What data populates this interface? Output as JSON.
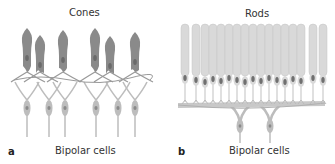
{
  "figure": {
    "panels": [
      {
        "letter": "a",
        "title": "Cones",
        "bottom_label": "Bipolar cells",
        "cone_x": [
          27,
          40,
          63,
          95,
          110,
          135
        ],
        "cone_top": [
          28,
          35,
          30,
          28,
          36,
          32
        ],
        "bipolar_x": [
          27,
          49,
          65,
          96,
          118,
          135
        ]
      },
      {
        "letter": "b",
        "title": "Rods",
        "bottom_label": "Bipolar cells",
        "rod_x": [
          185,
          196,
          205,
          213,
          221,
          229,
          237,
          245,
          253,
          261,
          269,
          277,
          285,
          293,
          301,
          313,
          323
        ],
        "bipolar_x": [
          240,
          270
        ]
      }
    ],
    "colors": {
      "cone_fill": "#8a8a8a",
      "cone_nucleus": "#6a6a6a",
      "rod_fill": "#d9d9d9",
      "rod_stroke": "#c4c4c4",
      "rod_nucleus": "#707070",
      "bipolar_fill": "#bdbdbd",
      "connection": "#9a9a9a"
    }
  }
}
